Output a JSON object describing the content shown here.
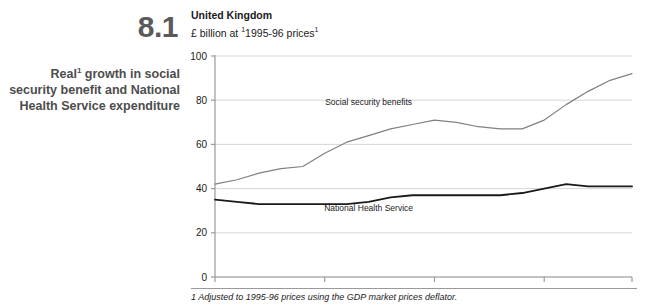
{
  "figure": {
    "number": "8.1",
    "caption_line1": "Real",
    "caption_sup": "1",
    "caption_line2": " growth in social security benefit and National Health Service expenditure"
  },
  "header": {
    "title": "United Kingdom",
    "subtitle_pre": "£ billion at ",
    "subtitle_sup_left": "1",
    "subtitle_main": "1995-96 prices",
    "subtitle_sup_right": "1"
  },
  "footnote": {
    "text": "1 Adjusted to 1995-96 prices using the GDP market prices deflator."
  },
  "chart_data": {
    "type": "line",
    "subtitle": "£ billion at 1995-96 prices",
    "xlabel": "",
    "ylabel": "",
    "ylim": [
      0,
      100
    ],
    "yticks": [
      0,
      20,
      40,
      60,
      80,
      100
    ],
    "ytick_labels": [
      "0",
      "20",
      "40",
      "60",
      "80",
      "100"
    ],
    "grid": true,
    "legend": "inline-labels",
    "x": [
      "1976-77",
      "1977-78",
      "1978-79",
      "1979-80",
      "1980-81",
      "1981-82",
      "1982-83",
      "1983-84",
      "1984-85",
      "1985-86",
      "1986-87",
      "1987-88",
      "1988-89",
      "1989-90",
      "1990-91",
      "1991-92",
      "1992-93",
      "1993-94",
      "1994-95",
      "1995-96"
    ],
    "xtick_labels": [
      "1976-77",
      "1981-82",
      "1986-87",
      "1991-92",
      "1995-96"
    ],
    "xtick_indices": [
      0,
      5,
      10,
      15,
      19
    ],
    "series": [
      {
        "name": "Social security benefits",
        "color": "#808080",
        "values": [
          42,
          44,
          47,
          49,
          50,
          56,
          61,
          64,
          67,
          69,
          71,
          70,
          68,
          67,
          67,
          71,
          78,
          84,
          89,
          92
        ]
      },
      {
        "name": "National Health Service",
        "color": "#1a1a1a",
        "values": [
          35,
          34,
          33,
          33,
          33,
          33,
          33,
          34,
          36,
          37,
          37,
          37,
          37,
          37,
          38,
          40,
          42,
          41,
          41,
          41
        ]
      }
    ],
    "annotations": [
      {
        "label": "Social security benefits",
        "sup": "",
        "x_index": 7,
        "y_value": 78
      },
      {
        "label": "National Health Service",
        "sup": "",
        "x_index": 7,
        "y_value": 30
      }
    ]
  }
}
